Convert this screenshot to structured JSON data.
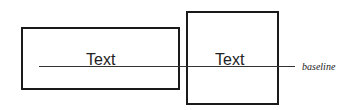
{
  "diagram": {
    "boxes": [
      {
        "label": "Text"
      },
      {
        "label": "Text"
      }
    ],
    "baseline": {
      "label": "baseline"
    },
    "colors": {
      "stroke": "#1a1a1a",
      "line": "#333333"
    }
  }
}
